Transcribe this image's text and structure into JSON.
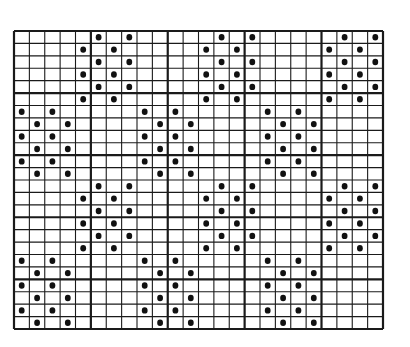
{
  "diagram": {
    "type": "dot-grid-pattern",
    "grid": {
      "cols": 24,
      "rows": 24,
      "left": 14,
      "top": 31,
      "right": 383,
      "bottom": 329,
      "major_every": 5,
      "line_color": "#1a1a1a",
      "background": "#ffffff"
    },
    "dot_color": "#111111",
    "dots": [
      [
        0,
        5
      ],
      [
        0,
        7
      ],
      [
        0,
        13
      ],
      [
        0,
        15
      ],
      [
        0,
        21
      ],
      [
        0,
        23
      ],
      [
        1,
        4
      ],
      [
        1,
        6
      ],
      [
        1,
        12
      ],
      [
        1,
        14
      ],
      [
        1,
        20
      ],
      [
        1,
        22
      ],
      [
        2,
        5
      ],
      [
        2,
        7
      ],
      [
        2,
        13
      ],
      [
        2,
        15
      ],
      [
        2,
        21
      ],
      [
        2,
        23
      ],
      [
        3,
        4
      ],
      [
        3,
        6
      ],
      [
        3,
        12
      ],
      [
        3,
        14
      ],
      [
        3,
        20
      ],
      [
        3,
        22
      ],
      [
        4,
        5
      ],
      [
        4,
        7
      ],
      [
        4,
        13
      ],
      [
        4,
        15
      ],
      [
        4,
        21
      ],
      [
        4,
        23
      ],
      [
        5,
        4
      ],
      [
        5,
        6
      ],
      [
        5,
        12
      ],
      [
        5,
        14
      ],
      [
        5,
        20
      ],
      [
        5,
        22
      ],
      [
        6,
        0
      ],
      [
        6,
        2
      ],
      [
        6,
        8
      ],
      [
        6,
        10
      ],
      [
        6,
        16
      ],
      [
        6,
        18
      ],
      [
        7,
        1
      ],
      [
        7,
        3
      ],
      [
        7,
        9
      ],
      [
        7,
        11
      ],
      [
        7,
        17
      ],
      [
        7,
        19
      ],
      [
        8,
        0
      ],
      [
        8,
        2
      ],
      [
        8,
        8
      ],
      [
        8,
        10
      ],
      [
        8,
        16
      ],
      [
        8,
        18
      ],
      [
        9,
        1
      ],
      [
        9,
        3
      ],
      [
        9,
        9
      ],
      [
        9,
        11
      ],
      [
        9,
        17
      ],
      [
        9,
        19
      ],
      [
        10,
        0
      ],
      [
        10,
        2
      ],
      [
        10,
        8
      ],
      [
        10,
        10
      ],
      [
        10,
        16
      ],
      [
        10,
        18
      ],
      [
        11,
        1
      ],
      [
        11,
        3
      ],
      [
        11,
        9
      ],
      [
        11,
        11
      ],
      [
        11,
        17
      ],
      [
        11,
        19
      ],
      [
        12,
        5
      ],
      [
        12,
        7
      ],
      [
        12,
        13
      ],
      [
        12,
        15
      ],
      [
        12,
        21
      ],
      [
        12,
        23
      ],
      [
        13,
        4
      ],
      [
        13,
        6
      ],
      [
        13,
        12
      ],
      [
        13,
        14
      ],
      [
        13,
        20
      ],
      [
        13,
        22
      ],
      [
        14,
        5
      ],
      [
        14,
        7
      ],
      [
        14,
        13
      ],
      [
        14,
        15
      ],
      [
        14,
        21
      ],
      [
        14,
        23
      ],
      [
        15,
        4
      ],
      [
        15,
        6
      ],
      [
        15,
        12
      ],
      [
        15,
        14
      ],
      [
        15,
        20
      ],
      [
        15,
        22
      ],
      [
        16,
        5
      ],
      [
        16,
        7
      ],
      [
        16,
        13
      ],
      [
        16,
        15
      ],
      [
        16,
        21
      ],
      [
        16,
        23
      ],
      [
        17,
        4
      ],
      [
        17,
        6
      ],
      [
        17,
        12
      ],
      [
        17,
        14
      ],
      [
        17,
        20
      ],
      [
        17,
        22
      ],
      [
        18,
        0
      ],
      [
        18,
        2
      ],
      [
        18,
        8
      ],
      [
        18,
        10
      ],
      [
        18,
        16
      ],
      [
        18,
        18
      ],
      [
        19,
        1
      ],
      [
        19,
        3
      ],
      [
        19,
        9
      ],
      [
        19,
        11
      ],
      [
        19,
        17
      ],
      [
        19,
        19
      ],
      [
        20,
        0
      ],
      [
        20,
        2
      ],
      [
        20,
        8
      ],
      [
        20,
        10
      ],
      [
        20,
        16
      ],
      [
        20,
        18
      ],
      [
        21,
        1
      ],
      [
        21,
        3
      ],
      [
        21,
        9
      ],
      [
        21,
        11
      ],
      [
        21,
        17
      ],
      [
        21,
        19
      ],
      [
        22,
        0
      ],
      [
        22,
        2
      ],
      [
        22,
        8
      ],
      [
        22,
        10
      ],
      [
        22,
        16
      ],
      [
        22,
        18
      ],
      [
        23,
        1
      ],
      [
        23,
        3
      ],
      [
        23,
        9
      ],
      [
        23,
        11
      ],
      [
        23,
        17
      ],
      [
        23,
        19
      ]
    ]
  }
}
